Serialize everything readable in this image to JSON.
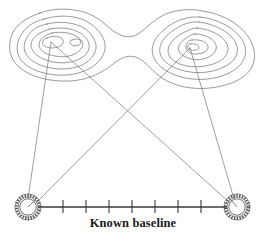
{
  "figure": {
    "caption": "Known baseline",
    "colors": {
      "contour_line": "#6e6e6e",
      "sight_line": "#6a6a6a",
      "baseline": "#3a3a3a",
      "station_ring": "#555555",
      "background": "#ffffff",
      "caption_text": "#1a1a1a"
    },
    "stations": [
      {
        "name": "left-station",
        "x": 28,
        "y": 207,
        "radius": 11
      },
      {
        "name": "right-station",
        "x": 237,
        "y": 207,
        "radius": 11
      }
    ],
    "peaks": [
      {
        "name": "left-peak",
        "x": 51,
        "y": 42
      },
      {
        "name": "right-peak",
        "x": 190,
        "y": 48
      }
    ],
    "sight_lines": [
      {
        "name": "left-station-to-left-peak",
        "from": "left-station",
        "to": "left-peak"
      },
      {
        "name": "left-station-to-right-peak",
        "from": "left-station",
        "to": "right-peak"
      },
      {
        "name": "right-station-to-left-peak",
        "from": "right-station",
        "to": "left-peak"
      },
      {
        "name": "right-station-to-right-peak",
        "from": "right-station",
        "to": "right-peak"
      }
    ],
    "baseline": {
      "x1": 40,
      "x2": 225,
      "y": 207,
      "tick_count": 7,
      "tick_positions": [
        63,
        86,
        109,
        132,
        155,
        178,
        201
      ]
    }
  }
}
